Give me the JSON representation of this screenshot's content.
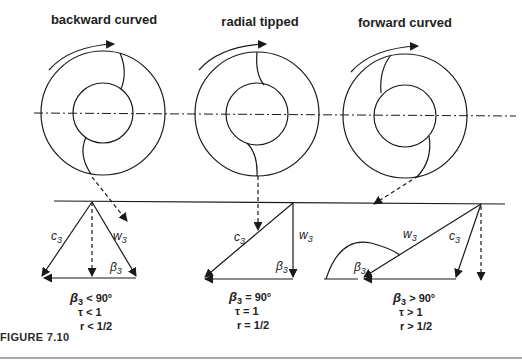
{
  "figure": {
    "caption": "FIGURE 7.10"
  },
  "panels": [
    {
      "title": "backward curved",
      "vectors": {
        "c": "c",
        "c_sub": "3",
        "w": "w",
        "w_sub": "3",
        "beta": "β",
        "beta_sub": "3"
      },
      "conditions": {
        "beta": " < 90°",
        "tau": "τ < 1",
        "r": "r < 1/2"
      }
    },
    {
      "title": "radial tipped",
      "vectors": {
        "c": "c",
        "c_sub": "3",
        "w": "w",
        "w_sub": "3",
        "beta": "β",
        "beta_sub": "3"
      },
      "conditions": {
        "beta": " = 90°",
        "tau": "τ = 1",
        "r": "r = 1/2"
      }
    },
    {
      "title": "forward curved",
      "vectors": {
        "c": "c",
        "c_sub": "3",
        "w": "w",
        "w_sub": "3",
        "beta": "β",
        "beta_sub": "3"
      },
      "conditions": {
        "beta": " > 90°",
        "tau": "τ > 1",
        "r": "r > 1/2"
      }
    }
  ],
  "colors": {
    "line": "#1a1a1a",
    "text": "#222222",
    "rule": "#888888"
  }
}
